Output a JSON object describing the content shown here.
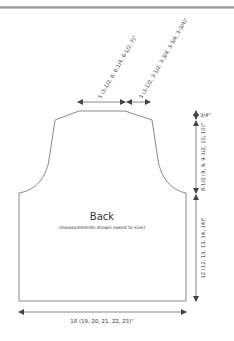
{
  "diagram": {
    "title": "Back",
    "subtitle": "(measurements shown eased to size)",
    "measurements": {
      "neck_width": "5 (5-1/2, 6, 6-1/4, 6-1/2, 7)\"",
      "shoulder_width": "3 (3-1/2, 3-1/2, 3-3/4, 3-3/4, 3-3/4)\"",
      "shoulder_slope": "3/4\"",
      "armhole_depth": "8-1/2 (9, 9, 9-1/2, 10, 10)\"",
      "body_length": "12 (12, 13, 13, 14, 14)\"",
      "body_width": "18 (19, 20, 21, 22, 23)\""
    },
    "colors": {
      "outline": "#7a7a7a",
      "text": "#333333",
      "arrow": "#555555"
    }
  }
}
